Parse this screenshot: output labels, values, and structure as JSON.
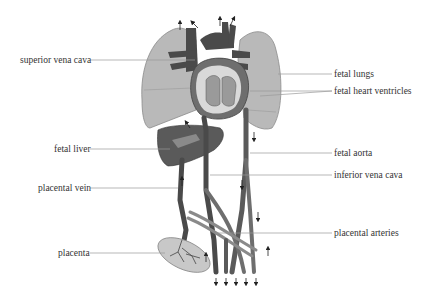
{
  "diagram": {
    "labels_left": [
      {
        "id": "superior-vena-cava",
        "text": "superior vena cava",
        "x": 20,
        "y": 55,
        "line_to_x": 195,
        "line_y": 60
      },
      {
        "id": "fetal-liver",
        "text": "fetal liver",
        "x": 54,
        "y": 144,
        "line_to_x": 158,
        "line_y": 149
      },
      {
        "id": "placental-vein",
        "text": "placental vein",
        "x": 38,
        "y": 183,
        "line_to_x": 175,
        "line_y": 188
      },
      {
        "id": "placenta",
        "text": "placenta",
        "x": 58,
        "y": 248,
        "line_to_x": 163,
        "line_y": 253
      }
    ],
    "labels_right": [
      {
        "id": "fetal-lungs",
        "text": "fetal lungs",
        "x": 334,
        "y": 69,
        "line_from_x": 278,
        "line_y": 74
      },
      {
        "id": "fetal-heart-ventricles",
        "text": "fetal heart ventricles",
        "x": 334,
        "y": 86,
        "line_from_x": 250,
        "line_y": 91
      },
      {
        "id": "fetal-aorta",
        "text": "fetal aorta",
        "x": 334,
        "y": 148,
        "line_from_x": 250,
        "line_y": 153
      },
      {
        "id": "inferior-vena-cava",
        "text": "inferior vena cava",
        "x": 334,
        "y": 170,
        "line_from_x": 210,
        "line_y": 175
      },
      {
        "id": "placental-arteries",
        "text": "placental arteries",
        "x": 334,
        "y": 228,
        "line_from_x": 215,
        "line_y": 233
      }
    ],
    "colors": {
      "lung": "#b9b9b9",
      "lung_edge": "#8a8a8a",
      "vessel_dark": "#4a4a4a",
      "vessel_mid": "#6e6e6e",
      "liver": "#5a5a5a",
      "heart_light": "#d9d9d9",
      "leader_line": "#9a9a9a",
      "text": "#333333"
    }
  }
}
